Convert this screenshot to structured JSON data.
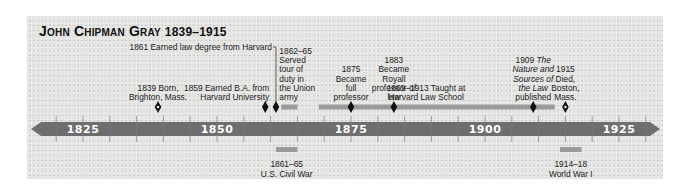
{
  "title": {
    "name": "John Chipman Gray",
    "years": "1839–1915"
  },
  "chart_data": {
    "type": "timeline",
    "axis": {
      "range": [
        1820,
        1932
      ],
      "major_ticks": [
        1825,
        1850,
        1875,
        1900,
        1925
      ],
      "minor_tick_interval": 5
    },
    "colors": {
      "axis_band": "#6e6e6e",
      "span_bar": "#9a9a9a",
      "marker": "#111111",
      "background": "#e4e4e2"
    },
    "life_events": [
      {
        "year": 1839,
        "marker": "open-diamond",
        "lines": [
          "1839 Born,",
          "Brighton, Mass."
        ]
      },
      {
        "year": 1859,
        "marker": "diamond",
        "lines": [
          "1859 Earned B.A. from",
          "Harvard University"
        ]
      },
      {
        "year": 1861,
        "marker": "diamond",
        "leader": true,
        "lines": [
          "1861 Earned law degree from Harvard"
        ]
      },
      {
        "start": 1862,
        "end": 1865,
        "marker": "span",
        "lines": [
          "1862–65",
          "Served",
          "tour of",
          "duty in",
          "the Union",
          "army"
        ]
      },
      {
        "year": 1875,
        "marker": "diamond",
        "lines": [
          "1875",
          "Became",
          "full",
          "professor"
        ]
      },
      {
        "year": 1883,
        "marker": "diamond",
        "lines": [
          "1883",
          "Became",
          "Royall",
          "professor of",
          "law"
        ]
      },
      {
        "start": 1869,
        "end": 1913,
        "marker": "span",
        "lines": [
          "1869–1913 Taught at",
          "Harvard Law School"
        ]
      },
      {
        "year": 1909,
        "marker": "diamond",
        "lines": [
          "1909 The",
          "Nature and",
          "Sources of",
          "the Law",
          "published"
        ],
        "italic_parts": [
          "The",
          "Nature and",
          "Sources of",
          "the Law"
        ]
      },
      {
        "year": 1915,
        "marker": "open-diamond",
        "lines": [
          "1915",
          "Died,",
          "Boston,",
          "Mass."
        ]
      }
    ],
    "world_events": [
      {
        "start": 1861,
        "end": 1865,
        "lines": [
          "1861–65",
          "U.S. Civil War"
        ]
      },
      {
        "start": 1914,
        "end": 1918,
        "lines": [
          "1914–18",
          "World War I"
        ]
      }
    ]
  }
}
